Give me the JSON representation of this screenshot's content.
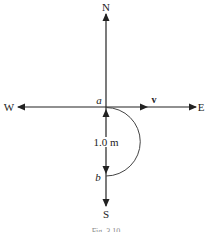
{
  "diagram": {
    "directions": {
      "north": "N",
      "south": "S",
      "east": "E",
      "west": "W"
    },
    "points": {
      "start": "a",
      "end": "b"
    },
    "velocity_label": "v",
    "distance_label": "1.0 m",
    "caption": "Fig. 3.10",
    "colors": {
      "line": "#222222",
      "background": "#ffffff"
    }
  }
}
